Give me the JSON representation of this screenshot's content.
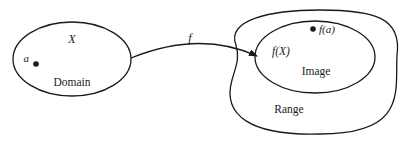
{
  "diagram": {
    "type": "function-mapping",
    "domain": {
      "set_label": "X",
      "region_label": "Domain",
      "point_label": "a"
    },
    "arrow": {
      "label": "f"
    },
    "codomain": {
      "region_label": "Range",
      "image": {
        "set_label": "f(X)",
        "region_label": "Image",
        "point_label": "f(a)"
      }
    },
    "colors": {
      "stroke": "#1a1a1a",
      "background": "#ffffff"
    }
  }
}
